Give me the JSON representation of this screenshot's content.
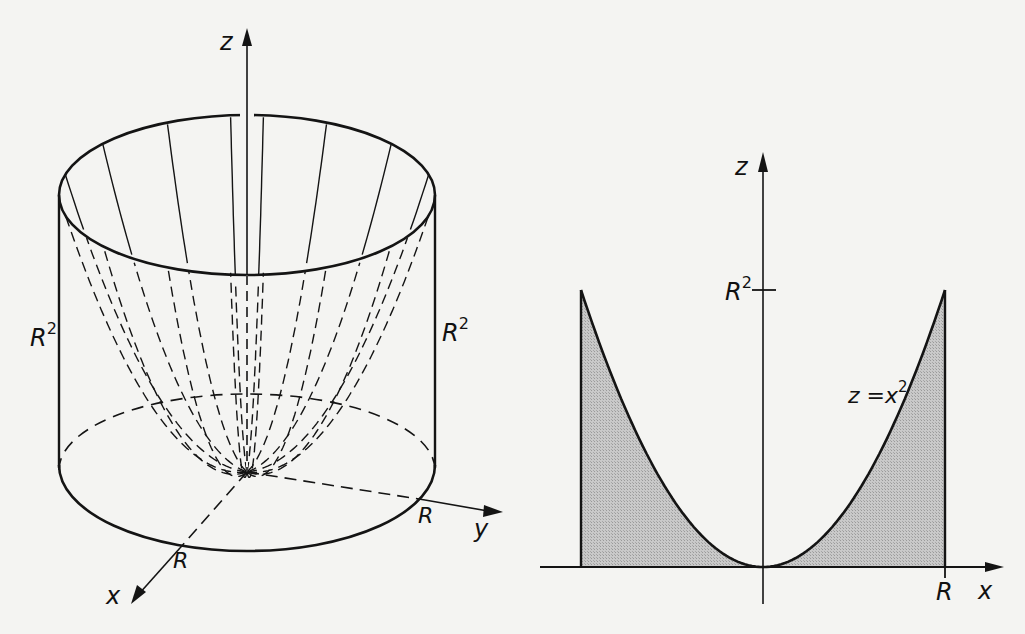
{
  "colors": {
    "background": "#f4f4f2",
    "ink": "#141414",
    "shade": "#bdbdbd"
  },
  "left_figure": {
    "description": "Paraboloid z = x^2 + y^2 inscribed in a cylinder of radius R and height R^2",
    "labels": {
      "z_axis": "z",
      "x_axis": "x",
      "y_axis": "y",
      "height_left": "R",
      "height_left_sup": "2",
      "height_right": "R",
      "height_right_sup": "2",
      "radius_x": "R",
      "radius_y": "R"
    },
    "geometry": {
      "cx": 247,
      "apex_y": 472,
      "height": 277,
      "rx": 188,
      "ry": 78,
      "meridian_angles_deg": [
        -165,
        -140,
        -115,
        -95,
        -85,
        -65,
        -40,
        -15,
        15,
        40,
        65,
        85,
        95,
        115,
        140,
        165
      ]
    }
  },
  "right_figure": {
    "description": "Cross-section: parabola z = x^2 on [-R, R], shaded region between curve and x-axis",
    "labels": {
      "z_axis": "z",
      "x_axis": "x",
      "r_tick": "R",
      "r2_tick": "R",
      "r2_tick_sup": "2",
      "curve": "z =x",
      "curve_sup": "2"
    },
    "geometry": {
      "ox": 763,
      "oy": 567,
      "half_width": 182,
      "height": 277
    }
  }
}
